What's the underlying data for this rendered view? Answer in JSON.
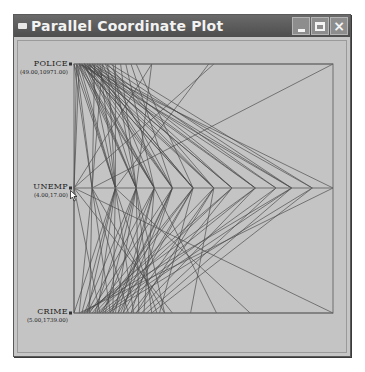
{
  "window": {
    "title": "Parallel Coordinate Plot",
    "controls": {
      "minimize": "minimize",
      "maximize": "maximize",
      "close": "×"
    },
    "colors": {
      "titlebar": "#5a5a5a",
      "background": "#c6c6c6",
      "lines": "#4a4a4a",
      "frame": "#6e6e6e"
    }
  },
  "axes": [
    {
      "name": "POLICE",
      "range": "(49.00,10971.00)"
    },
    {
      "name": "UNEMP",
      "range": "(4.00,17.00)"
    },
    {
      "name": "CRIME",
      "range": "(5.00,1739.00)"
    }
  ],
  "chart_data": {
    "type": "line",
    "title": "Parallel Coordinate Plot",
    "orientation": "horizontal-axes",
    "variables": [
      "POLICE",
      "UNEMP",
      "CRIME"
    ],
    "ranges": {
      "POLICE": [
        49.0,
        10971.0
      ],
      "UNEMP": [
        4.0,
        17.0
      ],
      "CRIME": [
        5.0,
        1739.0
      ]
    },
    "note": "Each polyline is one observation; position along each horizontal axis is the normalized value (0 = left, 1 = right).",
    "series": [
      {
        "name": "obs",
        "values": [
          0.0,
          0.07,
          0.02
        ]
      },
      {
        "name": "obs",
        "values": [
          0.01,
          0.16,
          0.03
        ]
      },
      {
        "name": "obs",
        "values": [
          0.02,
          0.24,
          0.04
        ]
      },
      {
        "name": "obs",
        "values": [
          0.02,
          0.31,
          0.05
        ]
      },
      {
        "name": "obs",
        "values": [
          0.03,
          0.38,
          0.06
        ]
      },
      {
        "name": "obs",
        "values": [
          0.03,
          0.46,
          0.07
        ]
      },
      {
        "name": "obs",
        "values": [
          0.04,
          0.54,
          0.08
        ]
      },
      {
        "name": "obs",
        "values": [
          0.04,
          0.61,
          0.09
        ]
      },
      {
        "name": "obs",
        "values": [
          0.05,
          0.7,
          0.1
        ]
      },
      {
        "name": "obs",
        "values": [
          0.05,
          0.78,
          0.11
        ]
      },
      {
        "name": "obs",
        "values": [
          0.06,
          0.84,
          0.12
        ]
      },
      {
        "name": "obs",
        "values": [
          0.07,
          0.92,
          0.13
        ]
      },
      {
        "name": "obs",
        "values": [
          0.01,
          0.07,
          0.14
        ]
      },
      {
        "name": "obs",
        "values": [
          0.02,
          0.16,
          0.15
        ]
      },
      {
        "name": "obs",
        "values": [
          0.03,
          0.24,
          0.16
        ]
      },
      {
        "name": "obs",
        "values": [
          0.04,
          0.31,
          0.17
        ]
      },
      {
        "name": "obs",
        "values": [
          0.05,
          0.38,
          0.18
        ]
      },
      {
        "name": "obs",
        "values": [
          0.06,
          0.46,
          0.19
        ]
      },
      {
        "name": "obs",
        "values": [
          0.07,
          0.54,
          0.2
        ]
      },
      {
        "name": "obs",
        "values": [
          0.08,
          0.61,
          0.22
        ]
      },
      {
        "name": "obs",
        "values": [
          0.09,
          0.7,
          0.24
        ]
      },
      {
        "name": "obs",
        "values": [
          0.1,
          0.78,
          0.26
        ]
      },
      {
        "name": "obs",
        "values": [
          0.12,
          0.84,
          0.28
        ]
      },
      {
        "name": "obs",
        "values": [
          0.14,
          0.92,
          0.3
        ]
      },
      {
        "name": "obs",
        "values": [
          0.16,
          0.16,
          0.05
        ]
      },
      {
        "name": "obs",
        "values": [
          0.18,
          0.24,
          0.08
        ]
      },
      {
        "name": "obs",
        "values": [
          0.2,
          0.31,
          0.11
        ]
      },
      {
        "name": "obs",
        "values": [
          0.22,
          0.38,
          0.14
        ]
      },
      {
        "name": "obs",
        "values": [
          0.24,
          0.46,
          0.17
        ]
      },
      {
        "name": "obs",
        "values": [
          0.11,
          0.07,
          0.21
        ]
      },
      {
        "name": "obs",
        "values": [
          0.13,
          0.16,
          0.23
        ]
      },
      {
        "name": "obs",
        "values": [
          0.15,
          0.24,
          0.25
        ]
      },
      {
        "name": "obs",
        "values": [
          0.05,
          0.31,
          0.27
        ]
      },
      {
        "name": "obs",
        "values": [
          0.06,
          0.16,
          0.32
        ]
      },
      {
        "name": "obs",
        "values": [
          0.3,
          0.24,
          0.35
        ]
      },
      {
        "name": "obs",
        "values": [
          0.3,
          0.0,
          0.38
        ]
      },
      {
        "name": "obs",
        "values": [
          0.52,
          0.16,
          0.0
        ]
      },
      {
        "name": "obs",
        "values": [
          0.54,
          0.0,
          0.1
        ]
      },
      {
        "name": "obs",
        "values": [
          0.04,
          0.61,
          0.05
        ]
      },
      {
        "name": "obs",
        "values": [
          0.03,
          0.7,
          0.04
        ]
      },
      {
        "name": "obs",
        "values": [
          0.02,
          0.84,
          0.03
        ]
      },
      {
        "name": "obs",
        "values": [
          0.02,
          1.0,
          0.02
        ]
      },
      {
        "name": "obs",
        "values": [
          1.0,
          0.07,
          0.35
        ]
      },
      {
        "name": "obs",
        "values": [
          0.02,
          0.0,
          1.0
        ]
      },
      {
        "name": "obs",
        "values": [
          0.01,
          0.0,
          0.0
        ]
      },
      {
        "name": "obs",
        "values": [
          0.08,
          0.07,
          0.06
        ]
      },
      {
        "name": "obs",
        "values": [
          0.1,
          0.16,
          0.09
        ]
      },
      {
        "name": "obs",
        "values": [
          0.09,
          0.24,
          0.12
        ]
      },
      {
        "name": "obs",
        "values": [
          0.07,
          0.38,
          0.15
        ]
      },
      {
        "name": "obs",
        "values": [
          0.06,
          0.46,
          0.1
        ]
      },
      {
        "name": "obs",
        "values": [
          0.11,
          0.31,
          0.19
        ]
      },
      {
        "name": "obs",
        "values": [
          0.12,
          0.38,
          0.22
        ]
      },
      {
        "name": "obs",
        "values": [
          0.13,
          0.54,
          0.24
        ]
      },
      {
        "name": "obs",
        "values": [
          0.04,
          0.24,
          0.3
        ]
      },
      {
        "name": "obs",
        "values": [
          0.03,
          0.46,
          0.33
        ]
      },
      {
        "name": "obs",
        "values": [
          0.02,
          0.54,
          0.45
        ]
      },
      {
        "name": "obs",
        "values": [
          0.01,
          0.31,
          0.55
        ]
      },
      {
        "name": "obs",
        "values": [
          0.0,
          0.16,
          0.68
        ]
      }
    ]
  }
}
